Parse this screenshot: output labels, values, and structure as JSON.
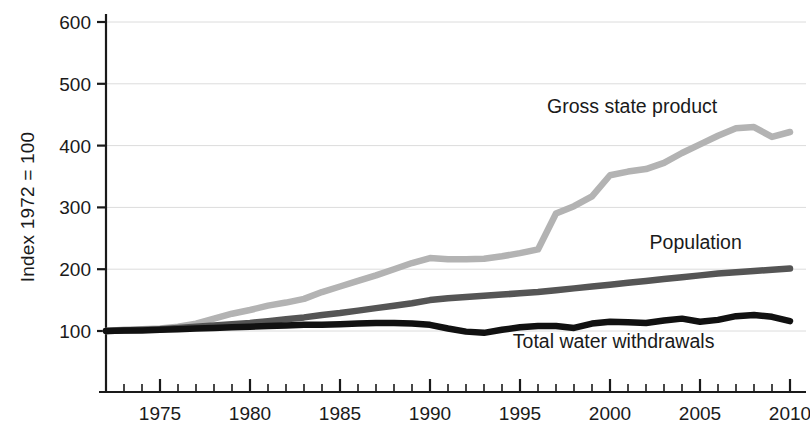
{
  "chart_data": {
    "type": "line",
    "title": "",
    "xlabel": "",
    "ylabel": "Index 1972 = 100",
    "xlim": [
      1972,
      2010
    ],
    "ylim": [
      0,
      600
    ],
    "grid": true,
    "legend_position": "inline-end-of-line",
    "y_ticks": [
      100,
      200,
      300,
      400,
      500,
      600
    ],
    "x_ticks": [
      1975,
      1980,
      1985,
      1990,
      1995,
      2000,
      2005,
      2010
    ],
    "x_tick_interval_minor": 1,
    "x": [
      1972,
      1973,
      1974,
      1975,
      1976,
      1977,
      1978,
      1979,
      1980,
      1981,
      1982,
      1983,
      1984,
      1985,
      1986,
      1987,
      1988,
      1989,
      1990,
      1991,
      1992,
      1993,
      1994,
      1995,
      1996,
      1997,
      1998,
      1999,
      2000,
      2001,
      2002,
      2003,
      2004,
      2005,
      2006,
      2007,
      2008,
      2009,
      2010
    ],
    "series": [
      {
        "name": "Gross state product",
        "color": "#b3b3b3",
        "label_x": 1996.5,
        "label_y": 452,
        "values": [
          100,
          102,
          103,
          104,
          107,
          112,
          120,
          128,
          134,
          141,
          146,
          152,
          163,
          172,
          181,
          190,
          200,
          210,
          218,
          216,
          216,
          217,
          221,
          226,
          232,
          290,
          302,
          318,
          352,
          358,
          362,
          372,
          388,
          402,
          416,
          428,
          430,
          414,
          422
        ]
      },
      {
        "name": "Population",
        "color": "#555555",
        "label_x": 2002.2,
        "label_y": 233,
        "values": [
          100,
          101,
          102,
          103,
          105,
          107,
          109,
          111,
          113,
          116,
          119,
          122,
          126,
          129,
          133,
          137,
          141,
          145,
          150,
          153,
          155,
          157,
          159,
          161,
          163,
          166,
          169,
          172,
          175,
          178,
          181,
          184,
          187,
          190,
          193,
          195,
          197,
          199,
          201
        ]
      },
      {
        "name": "Total water withdrawals",
        "color": "#111111",
        "label_x": 1994.6,
        "label_y": 72,
        "values": [
          100,
          101,
          101,
          102,
          103,
          104,
          105,
          106,
          107,
          108,
          109,
          110,
          110,
          111,
          112,
          113,
          113,
          112,
          110,
          104,
          99,
          97,
          102,
          106,
          108,
          108,
          105,
          112,
          115,
          114,
          113,
          117,
          120,
          115,
          118,
          124,
          126,
          123,
          116
        ]
      }
    ]
  }
}
